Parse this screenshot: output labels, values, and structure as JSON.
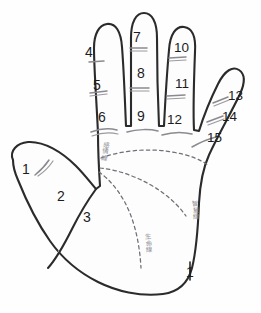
{
  "diagram": {
    "colors": {
      "outline": "#2b2b2b",
      "crease": "#8a8a90",
      "palm_line": "#6f6f78",
      "number_text": "#1d1d1d",
      "label_text": "#8e8e96",
      "background": "#fefefe"
    }
  },
  "numbers": {
    "thumb": [
      {
        "value": "1",
        "x": 22,
        "y": 162
      },
      {
        "value": "2",
        "x": 57,
        "y": 189
      },
      {
        "value": "3",
        "x": 83,
        "y": 210
      }
    ],
    "index_finger": [
      {
        "value": "4",
        "x": 85,
        "y": 45
      },
      {
        "value": "5",
        "x": 93,
        "y": 78
      },
      {
        "value": "6",
        "x": 98,
        "y": 110
      }
    ],
    "middle_finger": [
      {
        "value": "7",
        "x": 133,
        "y": 30
      },
      {
        "value": "8",
        "x": 137,
        "y": 66
      },
      {
        "value": "9",
        "x": 137,
        "y": 109
      }
    ],
    "ring_finger": [
      {
        "value": "10",
        "x": 174,
        "y": 41
      },
      {
        "value": "11",
        "x": 175,
        "y": 77
      },
      {
        "value": "12",
        "x": 167,
        "y": 113
      }
    ],
    "little_finger": [
      {
        "value": "13",
        "x": 228,
        "y": 89
      },
      {
        "value": "14",
        "x": 222,
        "y": 110
      },
      {
        "value": "15",
        "x": 207,
        "y": 131
      }
    ],
    "palm_edge": [
      {
        "value": "1",
        "x": 186,
        "y": 265
      }
    ]
  },
  "palm_lines": [
    {
      "name": "heart-line",
      "label": "感情線",
      "x": 100,
      "y": 141
    },
    {
      "name": "head-line",
      "label": "智慧線",
      "x": 190,
      "y": 200
    },
    {
      "name": "life-line",
      "label": "生命線",
      "x": 143,
      "y": 233
    }
  ]
}
